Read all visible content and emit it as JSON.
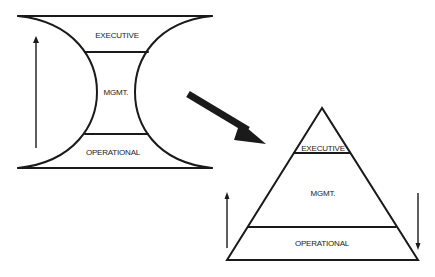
{
  "colors": {
    "ink": "#1a1a1a",
    "background": "#ffffff"
  },
  "hourglass": {
    "label_executive": "EXECUTIVE",
    "label_mgmt": "MGMT.",
    "label_operational": "OPERATIONAL",
    "arrow_direction": "up"
  },
  "transition_arrow": {
    "direction": "down-right"
  },
  "pyramid": {
    "label_executive": "EXECUTIVE",
    "label_mgmt": "MGMT.",
    "label_operational": "OPERATIONAL",
    "left_arrow_direction": "up",
    "right_arrow_direction": "down"
  }
}
